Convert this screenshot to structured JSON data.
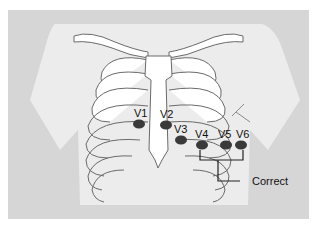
{
  "diagram": {
    "colors": {
      "panel": "#d6d6d6",
      "torso": "#ececec",
      "bone": "#ffffff",
      "outline": "#6a6a6a",
      "electrode": "#3a3a3a",
      "text": "#111111"
    },
    "electrodes": [
      {
        "id": "V1",
        "label": "V1",
        "cx": 139,
        "cy": 124
      },
      {
        "id": "V2",
        "label": "V2",
        "cx": 166,
        "cy": 125
      },
      {
        "id": "V3",
        "label": "V3",
        "cx": 181,
        "cy": 140
      },
      {
        "id": "V4",
        "label": "V4",
        "cx": 202,
        "cy": 145
      },
      {
        "id": "V5",
        "label": "V5",
        "cx": 226,
        "cy": 145
      },
      {
        "id": "V6",
        "label": "V6",
        "cx": 241,
        "cy": 145
      }
    ],
    "annotation": {
      "label": "Correct"
    }
  }
}
